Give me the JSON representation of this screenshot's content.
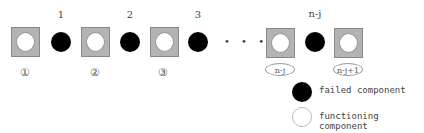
{
  "diagram": {
    "top_labels": [
      "1",
      "2",
      "3",
      "n-j"
    ],
    "bottom_labels": [
      "①",
      "②",
      "③"
    ],
    "oval_labels": [
      "n-j",
      "n-j+1"
    ],
    "ellipsis": "• • •",
    "legend": {
      "failed": "failed component",
      "functioning": "functioning component"
    },
    "colors": {
      "square_fill": "#b3b3b3",
      "failed": "#000000",
      "functioning": "#ffffff"
    }
  }
}
